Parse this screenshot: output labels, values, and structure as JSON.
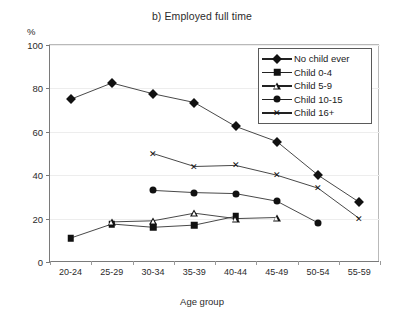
{
  "chart_data": {
    "type": "line",
    "title": "b) Employed full time",
    "xlabel": "Age group",
    "ylabel": "%",
    "ylim": [
      0,
      100
    ],
    "yticks": [
      0,
      20,
      40,
      60,
      80,
      100
    ],
    "grid": true,
    "legend_position": "top-right",
    "categories": [
      "20-24",
      "25-29",
      "30-34",
      "35-39",
      "40-44",
      "45-49",
      "50-54",
      "55-59"
    ],
    "series": [
      {
        "name": "No child ever",
        "marker": "diamond",
        "values": [
          75.0,
          82.5,
          77.5,
          73.5,
          62.5,
          55.5,
          40.0,
          27.5
        ]
      },
      {
        "name": "Child 0-4",
        "marker": "square",
        "values": [
          11.0,
          17.5,
          16.0,
          17.0,
          21.0,
          null,
          null,
          null
        ]
      },
      {
        "name": "Child 5-9",
        "marker": "triangle",
        "values": [
          null,
          18.5,
          19.0,
          22.5,
          20.0,
          20.5,
          null,
          null
        ]
      },
      {
        "name": "Child 10-15",
        "marker": "circle",
        "values": [
          null,
          null,
          33.0,
          32.0,
          31.5,
          28.0,
          18.0,
          null
        ]
      },
      {
        "name": "Child 16+",
        "marker": "x",
        "values": [
          null,
          null,
          50.0,
          44.0,
          44.5,
          40.0,
          34.0,
          20.0
        ]
      }
    ]
  }
}
